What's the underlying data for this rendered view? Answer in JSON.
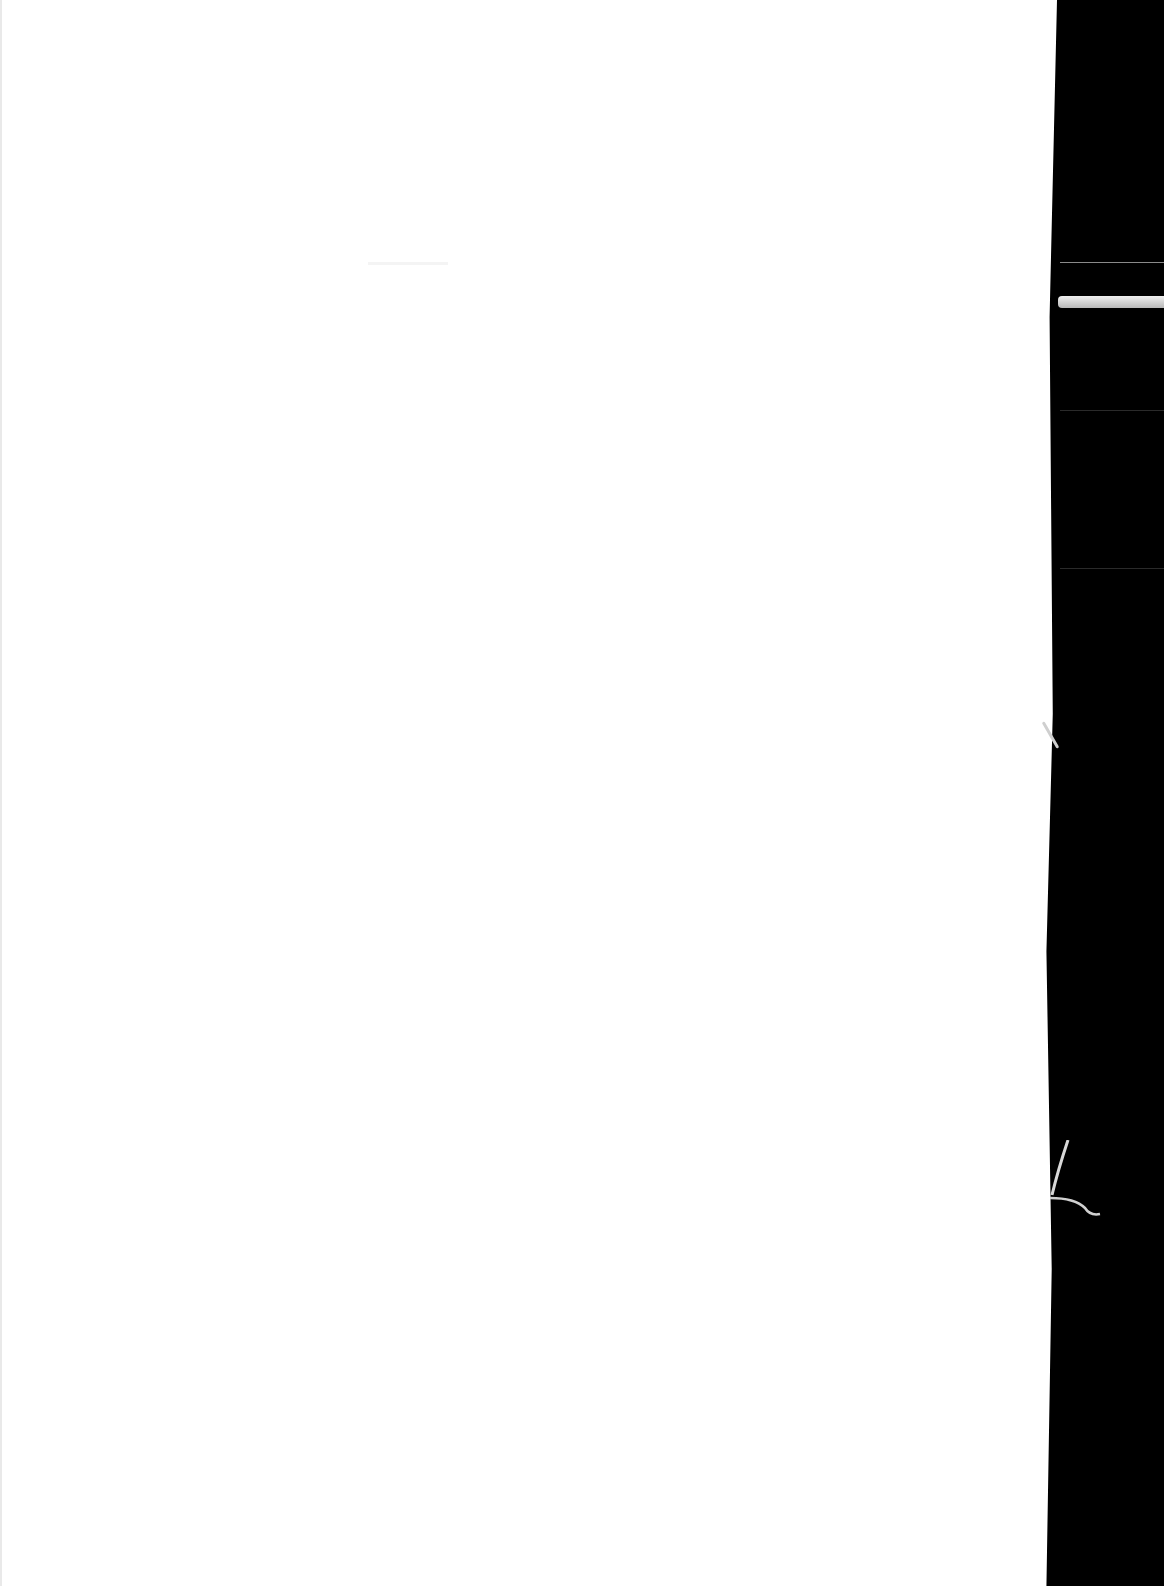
{
  "document": {
    "type": "scanned-page",
    "content": "",
    "page_color": "#ffffff",
    "background_color": "#000000"
  }
}
